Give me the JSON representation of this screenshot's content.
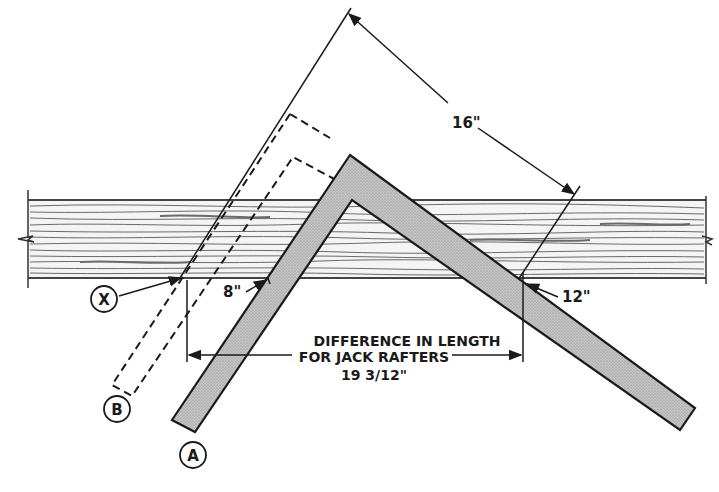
{
  "diagram": {
    "dimensions": {
      "blade_length": "16\"",
      "tongue_mark": "8\"",
      "blade_mark": "12\"",
      "difference_line1": "DIFFERENCE IN LENGTH",
      "difference_line2": "FOR JACK RAFTERS",
      "difference_value": "19 3/12\""
    },
    "markers": {
      "x": "X",
      "a": "A",
      "b": "B"
    },
    "colors": {
      "ink": "#1a1a1a",
      "square_fill": "#b9b9b9",
      "board_grain": "#6a6a6a",
      "background": "#ffffff"
    }
  }
}
